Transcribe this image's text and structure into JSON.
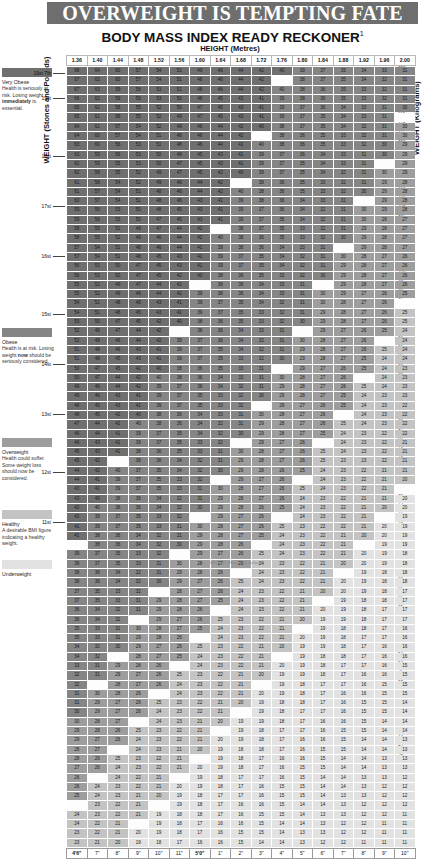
{
  "masthead": {
    "title": "OVERWEIGHT IS TEMPTING FATE"
  },
  "subtitle": {
    "text": "BODY MASS INDEX READY RECKONER",
    "footnote_mark": "1"
  },
  "axes": {
    "top_label": "HEIGHT (Metres)",
    "left_label": "WEIGHT (Stones and Pounds)",
    "right_label": "WEIGHT (Kilograms)",
    "bottom_label": "HEIGHT (Feet and Inches)"
  },
  "legend": [
    {
      "key": "very-obese",
      "swatch": "#6f6f6f",
      "heading": "Very Obese",
      "body": "Health is seriously at risk. Losing weight ",
      "body_bold": "immediately",
      "body_tail": " is essential."
    },
    {
      "key": "obese",
      "swatch": "#858585",
      "heading": "Obese",
      "body": "Health is at risk. Losing weight ",
      "body_bold": "now",
      "body_tail": " should be seriously considered."
    },
    {
      "key": "overweight",
      "swatch": "#9d9d9d",
      "heading": "Overweight",
      "body": "Health could suffer. Some weight loss should now be considered.",
      "body_bold": "",
      "body_tail": ""
    },
    {
      "key": "healthy",
      "swatch": "#c3c3c3",
      "heading": "Healthy",
      "body": "A desirable BMI figure indicating a healthy weight.",
      "body_bold": "",
      "body_tail": ""
    },
    {
      "key": "underweight",
      "swatch": "#e2e2e2",
      "heading": "Underweight",
      "body": "",
      "body_bold": "",
      "body_tail": ""
    }
  ],
  "footnote": "HEIGHT (Feet and Inches)",
  "chart_data": {
    "type": "heatmap",
    "title": "BODY MASS INDEX READY RECKONER",
    "xlabel": "HEIGHT (Metres)",
    "ylabel": "WEIGHT (Stones and Pounds)",
    "y2label": "WEIGHT (Kilograms)",
    "x2label": "HEIGHT (Feet and Inches)",
    "legend_position": "left",
    "grid": true,
    "formula": "BMI = kg / m^2",
    "heights_m": [
      1.36,
      1.4,
      1.44,
      1.48,
      1.52,
      1.56,
      1.6,
      1.64,
      1.68,
      1.72,
      1.76,
      1.8,
      1.84,
      1.88,
      1.92,
      1.96,
      2.0
    ],
    "heights_ft_in": [
      "4'6\"",
      "7\"",
      "8\"",
      "9\"",
      "10\"",
      "11\"",
      "5'0\"",
      "1\"",
      "2\"",
      "3\"",
      "4\"",
      "5\"",
      "6\"",
      "7\"",
      "8\"",
      "9\"",
      "10\"",
      "11\"",
      "6'0\"",
      "1\"",
      "2\"",
      "3\"",
      "4\"",
      "5\"",
      "6\"",
      "7\""
    ],
    "weights_kg_top": 125,
    "weights_kg_bottom": 42,
    "weight_step_kg": 1,
    "stone_ticks": [
      {
        "label": "19st 7lb",
        "kg": 124
      },
      {
        "label": "19st",
        "kg": 121
      },
      {
        "label": "18st",
        "kg": 114
      },
      {
        "label": "17st",
        "kg": 108
      },
      {
        "label": "16st",
        "kg": 102
      },
      {
        "label": "15st",
        "kg": 95
      },
      {
        "label": "14st",
        "kg": 89
      },
      {
        "label": "13st",
        "kg": 83
      },
      {
        "label": "12st",
        "kg": 76
      },
      {
        "label": "11st",
        "kg": 70
      },
      {
        "label": "10st",
        "kg": 64
      },
      {
        "label": "9st",
        "kg": 57
      },
      {
        "label": "8st",
        "kg": 51
      },
      {
        "label": "7st",
        "kg": 44
      },
      {
        "label": "6st 7lb",
        "kg": 42
      }
    ],
    "bmi_bands": [
      {
        "name": "Underweight",
        "min": 0,
        "max": 20,
        "color": "#e2e2e2"
      },
      {
        "name": "Healthy",
        "min": 20,
        "max": 25,
        "color": "#c3c3c3"
      },
      {
        "name": "Overweight",
        "min": 25,
        "max": 30,
        "color": "#9d9d9d"
      },
      {
        "name": "Obese",
        "min": 30,
        "max": 40,
        "color": "#858585"
      },
      {
        "name": "Very Obese",
        "min": 40,
        "max": 99,
        "color": "#6f6f6f"
      }
    ]
  }
}
